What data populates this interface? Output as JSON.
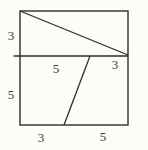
{
  "figure": {
    "type": "geometric-diagram",
    "labels": {
      "left_top": "3",
      "left_bottom": "5",
      "divider_left": "5",
      "divider_right": "3",
      "bottom_left": "3",
      "bottom_right": "5"
    },
    "colors": {
      "line": "#2e2e2e",
      "paper": "#fcfcf9",
      "text": "#3a3a3c"
    }
  }
}
